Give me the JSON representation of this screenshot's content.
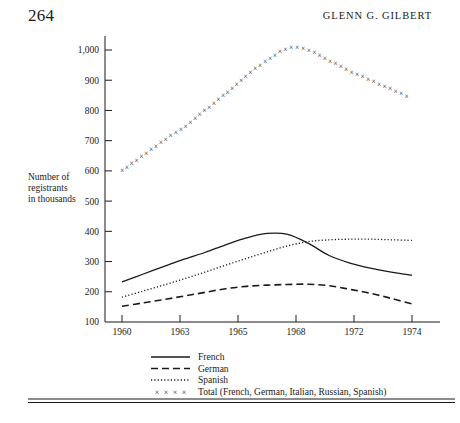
{
  "page": {
    "folio": "264",
    "running_head": "Glenn G. Gilbert"
  },
  "chart_data": {
    "type": "line",
    "title": "",
    "xlabel": "",
    "ylabel": "Number of registrants in thousands",
    "ylabel_lines": [
      "Number of",
      "registrants",
      "in thousands"
    ],
    "xlim": [
      1960,
      1974
    ],
    "ylim": [
      100,
      1000
    ],
    "ytick_labels": [
      "100",
      "200",
      "300",
      "400",
      "500",
      "600",
      "700",
      "800",
      "900",
      "1,000"
    ],
    "ytick_values": [
      100,
      200,
      300,
      400,
      500,
      600,
      700,
      800,
      900,
      1000
    ],
    "xtick_labels": [
      "1960",
      "1963",
      "1965",
      "1968",
      "1972",
      "1974"
    ],
    "xtick_values": [
      1960,
      1963,
      1965,
      1968,
      1972,
      1974
    ],
    "grid": false,
    "legend_position": "below-axes",
    "x": [
      1960,
      1961,
      1962,
      1963,
      1964,
      1965,
      1966,
      1967,
      1968,
      1969,
      1970,
      1971,
      1972,
      1973,
      1974
    ],
    "series": [
      {
        "name": "French",
        "style": "solid",
        "legend_label": "French",
        "values": [
          233,
          258,
          283,
          308,
          330,
          355,
          378,
          393,
          390,
          360,
          320,
          295,
          278,
          265,
          255
        ]
      },
      {
        "name": "German",
        "style": "dashed",
        "legend_label": "German",
        "values": [
          152,
          163,
          174,
          186,
          198,
          210,
          218,
          222,
          224,
          225,
          220,
          208,
          195,
          178,
          160
        ]
      },
      {
        "name": "Spanish",
        "style": "dotted",
        "legend_label": "Spanish",
        "values": [
          182,
          202,
          222,
          243,
          265,
          288,
          310,
          332,
          352,
          366,
          372,
          374,
          374,
          372,
          370
        ]
      },
      {
        "name": "Total",
        "style": "cross-markers",
        "legend_label": "Total (French, German, Italian, Russian, Spanish)",
        "marker": "×",
        "values": [
          600,
          650,
          700,
          745,
          800,
          855,
          915,
          965,
          1005,
          1000,
          965,
          930,
          900,
          870,
          840
        ]
      }
    ]
  },
  "colors": {
    "ink": "#1a1a1a",
    "background": "#ffffff"
  }
}
